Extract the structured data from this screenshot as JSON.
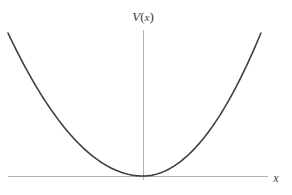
{
  "figure": {
    "background_color": "#ffffff",
    "width": 292,
    "height": 195,
    "axis_color": "#b3b3b3",
    "curve_color": "#3f3f3f",
    "label_color": "#3a3a3a",
    "y_axis_label": "V(x)",
    "y_axis_label_parts": {
      "symbol": "V",
      "open_paren": "(",
      "variable": "x",
      "close_paren": ")"
    },
    "x_axis_label": "x"
  },
  "chart_data": {
    "type": "line",
    "title": "",
    "subtitle": "",
    "xlabel": "x",
    "ylabel": "V(x)",
    "legend": [],
    "legend_position": "none",
    "grid": false,
    "annotations": [],
    "axes": {
      "x_axis": {
        "label": "x",
        "tick_labels": [],
        "range": [
          -1.0,
          1.06
        ],
        "pixel_start": 8,
        "pixel_end": 268,
        "pixel_y": 176,
        "color": "#b3b3b3"
      },
      "y_axis": {
        "label": "V(x)",
        "tick_labels": [],
        "range": [
          0,
          1.1
        ],
        "pixel_top": 30,
        "pixel_bottom": 180,
        "pixel_x": 143,
        "color": "#b3b3b3"
      }
    },
    "series": [
      {
        "name": "V(x) = x^2",
        "color": "#3f3f3f",
        "line_width": 1.6,
        "equation": "V(x) = x^2",
        "vertex": [
          0,
          0
        ],
        "x": [
          -1.0,
          -0.9,
          -0.8,
          -0.7,
          -0.6,
          -0.5,
          -0.4,
          -0.3,
          -0.2,
          -0.1,
          0.0,
          0.1,
          0.2,
          0.3,
          0.4,
          0.5,
          0.6,
          0.7,
          0.8,
          0.9,
          1.0
        ],
        "values": [
          1.0,
          0.81,
          0.64,
          0.49,
          0.36,
          0.25,
          0.16,
          0.09,
          0.04,
          0.01,
          0.0,
          0.01,
          0.04,
          0.09,
          0.16,
          0.25,
          0.36,
          0.49,
          0.64,
          0.81,
          1.0
        ]
      }
    ]
  }
}
